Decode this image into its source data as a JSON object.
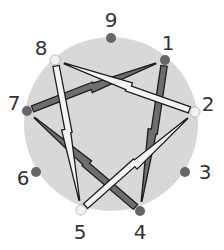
{
  "diagram": {
    "type": "enneagram",
    "circle": {
      "cx": 111,
      "cy": 124,
      "r": 87,
      "fill": "#d8d8d8"
    },
    "points": [
      {
        "id": "1",
        "label": "1",
        "x": 165,
        "y": 60,
        "lx": 168,
        "ly": 43,
        "style": "dark"
      },
      {
        "id": "2",
        "label": "2",
        "x": 195,
        "y": 112,
        "lx": 208,
        "ly": 104,
        "style": "light"
      },
      {
        "id": "3",
        "label": "3",
        "x": 185,
        "y": 172,
        "lx": 205,
        "ly": 172,
        "style": "dark"
      },
      {
        "id": "4",
        "label": "4",
        "x": 140,
        "y": 211,
        "lx": 140,
        "ly": 232,
        "style": "dark"
      },
      {
        "id": "5",
        "label": "5",
        "x": 81,
        "y": 210,
        "lx": 80,
        "ly": 232,
        "style": "light"
      },
      {
        "id": "6",
        "label": "6",
        "x": 36,
        "y": 172,
        "lx": 23,
        "ly": 178,
        "style": "dark"
      },
      {
        "id": "7",
        "label": "7",
        "x": 27,
        "y": 111,
        "lx": 14,
        "ly": 103,
        "style": "dark"
      },
      {
        "id": "8",
        "label": "8",
        "x": 55,
        "y": 60,
        "lx": 41,
        "ly": 48,
        "style": "light"
      },
      {
        "id": "9",
        "label": "9",
        "x": 111,
        "y": 38,
        "lx": 111,
        "ly": 20,
        "style": "dark"
      }
    ],
    "arrows": [
      {
        "from": "1",
        "to": "4",
        "style": "dark"
      },
      {
        "from": "7",
        "to": "1",
        "style": "dark"
      },
      {
        "from": "4",
        "to": "7",
        "style": "dark"
      },
      {
        "from": "2",
        "to": "8",
        "style": "light"
      },
      {
        "from": "8",
        "to": "5",
        "style": "light"
      },
      {
        "from": "5",
        "to": "2",
        "style": "light"
      }
    ],
    "colors": {
      "dark_dot": "#666666",
      "light_dot": "#f2f2f2",
      "dark_arrow": "#6e6e6e",
      "light_arrow": "#f4f4f4",
      "outline": "#1e1e1e"
    }
  }
}
